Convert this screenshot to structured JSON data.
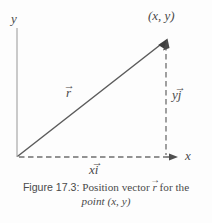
{
  "figure": {
    "axes": {
      "y_label": "y",
      "x_label": "x",
      "y_axis_color": "#b9b9b9",
      "x_axis_color": "#6a6a6a"
    },
    "labels": {
      "point": "(x, y)",
      "r_symbol": "r",
      "y_component_scalar": "y",
      "y_component_unit": "j",
      "x_component_scalar": "x",
      "x_component_unit": "i",
      "vector_accent": "→"
    },
    "caption": {
      "line1_prefix": "Figure 17.3:",
      "line1_middle": " Position vector ",
      "line1_vector": "r",
      "line1_suffix": " for the",
      "line2": "point (x, y)"
    },
    "geometry": {
      "origin_x": 17,
      "origin_y": 157,
      "point_x": 166,
      "point_y": 40,
      "y_axis_top": 28,
      "x_axis_end": 176
    },
    "colors": {
      "background": "#fdfdfd",
      "vector": "#5c5c5c",
      "dashed": "#707070",
      "text": "#4a4a4a"
    }
  }
}
